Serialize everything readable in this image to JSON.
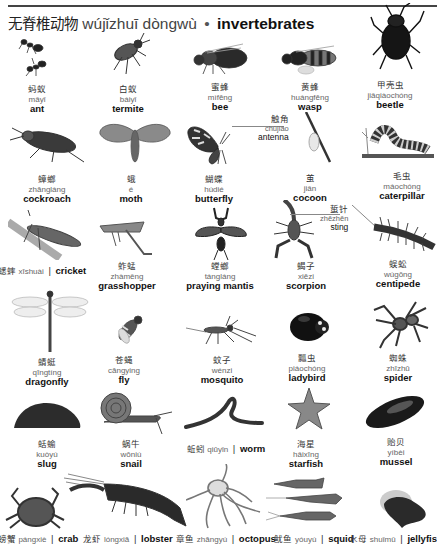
{
  "header": {
    "title_zh": "无脊椎动物",
    "title_pinyin": "wújǐzhuī dòngwù",
    "separator": "•",
    "title_en": "invertebrates"
  },
  "rows": [
    {
      "items": [
        {
          "zh": "蚂蚁",
          "pinyin": "mǎyǐ",
          "en": "ant",
          "icon": "ant-image"
        },
        {
          "zh": "白蚁",
          "pinyin": "báiyǐ",
          "en": "termite",
          "icon": "termite-image"
        },
        {
          "zh": "蜜蜂",
          "pinyin": "mìfēng",
          "en": "bee",
          "icon": "bee-image"
        },
        {
          "zh": "黄蜂",
          "pinyin": "huángfēng",
          "en": "wasp",
          "icon": "wasp-image"
        },
        {
          "zh": "甲壳虫",
          "pinyin": "jiǎqiàochóng",
          "en": "beetle",
          "icon": "beetle-image"
        }
      ]
    },
    {
      "items": [
        {
          "zh": "蟑螂",
          "pinyin": "zhāngláng",
          "en": "cockroach",
          "icon": "cockroach-image"
        },
        {
          "zh": "蛾",
          "pinyin": "é",
          "en": "moth",
          "icon": "moth-image"
        },
        {
          "zh": "蝴蝶",
          "pinyin": "húdié",
          "en": "butterfly",
          "icon": "butterfly-image"
        },
        {
          "zh": "茧",
          "pinyin": "jiǎn",
          "en": "cocoon",
          "icon": "cocoon-image"
        },
        {
          "zh": "毛虫",
          "pinyin": "máochóng",
          "en": "caterpillar",
          "icon": "caterpillar-image"
        }
      ],
      "callout": {
        "zh": "触角",
        "pinyin": "chùjiǎo",
        "en": "antenna"
      }
    },
    {
      "items": [
        {
          "zh": "蟋蟀",
          "pinyin": "xīshuài",
          "en": "cricket",
          "icon": "cricket-image",
          "inline": true
        },
        {
          "zh": "蚱蜢",
          "pinyin": "zhàměng",
          "en": "grasshopper",
          "icon": "grasshopper-image"
        },
        {
          "zh": "螳螂",
          "pinyin": "tángláng",
          "en": "praying mantis",
          "icon": "mantis-image"
        },
        {
          "zh": "蝎子",
          "pinyin": "xiēzi",
          "en": "scorpion",
          "icon": "scorpion-image"
        },
        {
          "zh": "蜈蚣",
          "pinyin": "wúgōng",
          "en": "centipede",
          "icon": "centipede-image"
        }
      ],
      "callout": {
        "zh": "蜇针",
        "pinyin": "zhēzhēn",
        "en": "sting"
      }
    },
    {
      "items": [
        {
          "zh": "蜻蜓",
          "pinyin": "qīngtíng",
          "en": "dragonfly",
          "icon": "dragonfly-image"
        },
        {
          "zh": "苍蝇",
          "pinyin": "cāngying",
          "en": "fly",
          "icon": "fly-image"
        },
        {
          "zh": "蚊子",
          "pinyin": "wénzi",
          "en": "mosquito",
          "icon": "mosquito-image"
        },
        {
          "zh": "瓢虫",
          "pinyin": "piáochóng",
          "en": "ladybird",
          "icon": "ladybird-image"
        },
        {
          "zh": "蜘蛛",
          "pinyin": "zhīzhū",
          "en": "spider",
          "icon": "spider-image"
        }
      ]
    },
    {
      "items": [
        {
          "zh": "蛞蝓",
          "pinyin": "kuòyú",
          "en": "slug",
          "icon": "slug-image"
        },
        {
          "zh": "蜗牛",
          "pinyin": "wōniú",
          "en": "snail",
          "icon": "snail-image"
        },
        {
          "zh": "蚯蚓",
          "pinyin": "qiūyǐn",
          "en": "worm",
          "icon": "worm-image",
          "inline": true
        },
        {
          "zh": "海星",
          "pinyin": "hǎixīng",
          "en": "starfish",
          "icon": "starfish-image"
        },
        {
          "zh": "贻贝",
          "pinyin": "yíbèi",
          "en": "mussel",
          "icon": "mussel-image"
        }
      ]
    },
    {
      "items": [
        {
          "zh": "螃蟹",
          "pinyin": "pángxiè",
          "en": "crab",
          "icon": "crab-image",
          "inline": true
        },
        {
          "zh": "龙虾",
          "pinyin": "lóngxiā",
          "en": "lobster",
          "icon": "lobster-image",
          "inline": true
        },
        {
          "zh": "章鱼",
          "pinyin": "zhāngyú",
          "en": "octopus",
          "icon": "octopus-image",
          "inline": true
        },
        {
          "zh": "鱿鱼",
          "pinyin": "yóuyú",
          "en": "squid",
          "icon": "squid-image",
          "inline": true
        },
        {
          "zh": "水母",
          "pinyin": "shuǐmǔ",
          "en": "jellyfish",
          "icon": "jellyfish-image",
          "inline": true
        }
      ]
    }
  ],
  "inline_separator": "|"
}
